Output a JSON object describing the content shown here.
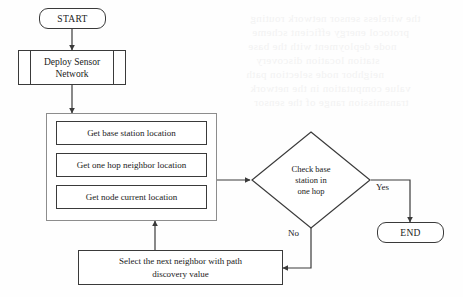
{
  "diagram": {
    "line_color": "#3a3a3a",
    "group_border_color": "#8d8d8d",
    "background": "#fefefe"
  },
  "nodes": {
    "start": {
      "label": "START",
      "shape": "terminator"
    },
    "deploy": {
      "label_line1": "Deploy Sensor",
      "label_line2": "Network",
      "shape": "predefined-process"
    },
    "get_base_station": {
      "label": "Get base station location",
      "shape": "process"
    },
    "get_one_hop": {
      "label": "Get one hop neighbor location",
      "shape": "process"
    },
    "get_node_current": {
      "label": "Get node current location",
      "shape": "process"
    },
    "decision": {
      "label_line1": "Check base",
      "label_line2": "station in",
      "label_line3": "one hop",
      "shape": "decision"
    },
    "select_neighbor": {
      "label_line1": "Select the next neighbor with path",
      "label_line2": "discovery value",
      "shape": "process"
    },
    "end": {
      "label": "END",
      "shape": "terminator"
    }
  },
  "edge_labels": {
    "yes": "Yes",
    "no": "No"
  },
  "ghost_text": {
    "line1": "the wireless sensor network routing",
    "line2": "protocol energy efficient scheme",
    "line3": "node deployment with the base",
    "line4": "station location discovery",
    "line5": "neighbor node selection path",
    "line6": "value computation in the network",
    "line7": "transmission range of the sensor"
  }
}
